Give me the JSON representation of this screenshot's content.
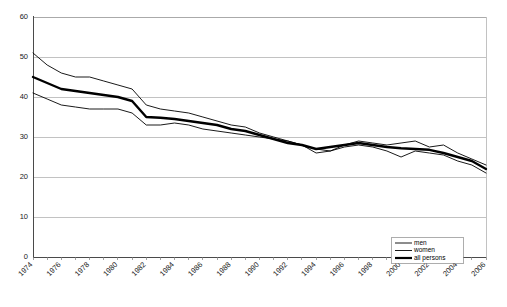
{
  "chart_data": {
    "type": "line",
    "title": "",
    "subtitle": "",
    "xlabel": "",
    "ylabel": "",
    "ylim": [
      0,
      60
    ],
    "xlim": [
      1974,
      2006
    ],
    "yticks": [
      0,
      10,
      20,
      30,
      40,
      50,
      60
    ],
    "ytick_labels": [
      "0",
      "10",
      "20",
      "30",
      "40",
      "50",
      "60"
    ],
    "xticks": [
      1974,
      1976,
      1978,
      1980,
      1982,
      1984,
      1986,
      1988,
      1990,
      1992,
      1994,
      1996,
      1998,
      2000,
      2002,
      2004,
      2006
    ],
    "xtick_labels": [
      "1974",
      "1976",
      "1978",
      "1980",
      "1982",
      "1984",
      "1986",
      "1988",
      "1990",
      "1992",
      "1994",
      "1996",
      "1998",
      "2000",
      "2002",
      "2004",
      "2006"
    ],
    "x": [
      1974,
      1975,
      1976,
      1977,
      1978,
      1979,
      1980,
      1981,
      1982,
      1983,
      1984,
      1985,
      1986,
      1987,
      1988,
      1989,
      1990,
      1991,
      1992,
      1993,
      1994,
      1995,
      1996,
      1997,
      1998,
      1999,
      2000,
      2001,
      2002,
      2003,
      2004,
      2005,
      2006
    ],
    "grid": true,
    "grid_axis": "y",
    "legend_position": "bottom-right",
    "series": [
      {
        "name": "men",
        "style": "thin",
        "color": "#000000",
        "values": [
          51,
          48,
          46,
          45,
          45,
          44,
          43,
          42,
          38,
          37,
          36.5,
          36,
          35,
          34,
          33,
          32.5,
          31,
          30,
          29,
          28,
          27,
          26.5,
          28,
          29,
          28.5,
          28,
          28.5,
          29,
          27.5,
          28,
          26,
          24.5,
          23
        ]
      },
      {
        "name": "women",
        "style": "thin",
        "color": "#000000",
        "values": [
          41,
          39.5,
          38,
          37.5,
          37,
          37,
          37,
          36,
          33,
          33,
          33.5,
          33,
          32,
          31.5,
          31,
          30.5,
          30,
          29.5,
          29,
          28,
          26,
          26.5,
          27.5,
          28,
          27.5,
          26.5,
          25,
          26.5,
          26,
          25.5,
          24,
          23,
          21
        ]
      },
      {
        "name": "all persons",
        "style": "thick",
        "color": "#000000",
        "values": [
          45,
          43.5,
          42,
          41.5,
          41,
          40.5,
          40,
          39,
          35,
          34.8,
          34.5,
          34,
          33.5,
          33,
          32,
          31.5,
          30.5,
          29.5,
          28.5,
          28,
          27,
          27.5,
          28,
          28.5,
          28,
          27.5,
          27.2,
          27,
          26.8,
          26,
          25,
          24,
          22
        ]
      }
    ]
  },
  "legend": {
    "items": [
      {
        "label": "men"
      },
      {
        "label": "women"
      },
      {
        "label": "all persons"
      }
    ]
  }
}
